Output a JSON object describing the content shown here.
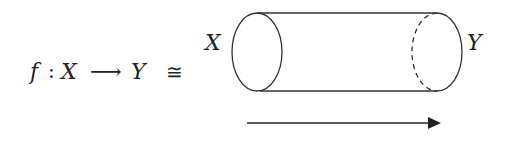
{
  "formula": {
    "f": "f",
    "colon": ":",
    "domain": "X",
    "arrow": "⟶",
    "codomain": "Y",
    "iso": "≅"
  },
  "cylinder": {
    "left_label": "X",
    "right_label": "Y",
    "stroke_color": "#333333"
  },
  "direction_arrow": {
    "color": "#222222"
  }
}
